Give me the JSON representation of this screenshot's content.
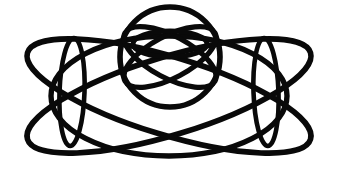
{
  "image": {
    "title": "Abstract symmetric line-art figure",
    "description": "Black ink line drawing of overlapping ellipses and circles forming a symmetric knot-like ornament on a white background",
    "width": 338,
    "height": 181,
    "background_color": "#ffffff",
    "stroke_color": "#090909",
    "style": "line-art",
    "symmetry": "bilateral-vertical-axis",
    "axis_x": 169
  },
  "geometry": {
    "stroke_widths": {
      "heavy": 6.2,
      "main": 5.4,
      "medium": 4.8,
      "fine": 4.2
    },
    "shapes": [
      {
        "name": "outer-dome-ellipse",
        "type": "ellipse",
        "cx": 169,
        "cy": 96,
        "rx": 120,
        "ry": 60,
        "rotation": 0
      },
      {
        "name": "large-ellipse-left-tilt",
        "type": "ellipse",
        "cx": 169,
        "cy": 96,
        "rx": 150,
        "ry": 40,
        "rotation": 17
      },
      {
        "name": "large-ellipse-right-tilt",
        "type": "ellipse",
        "cx": 169,
        "cy": 96,
        "rx": 150,
        "ry": 40,
        "rotation": -17
      },
      {
        "name": "narrow-ellipse-left",
        "type": "ellipse",
        "cx": 72,
        "cy": 92,
        "rx": 13,
        "ry": 54,
        "rotation": 2
      },
      {
        "name": "narrow-ellipse-right",
        "type": "ellipse",
        "cx": 266,
        "cy": 92,
        "rx": 13,
        "ry": 54,
        "rotation": -2
      },
      {
        "name": "center-circle",
        "type": "circle",
        "cx": 170,
        "cy": 57,
        "r": 50
      },
      {
        "name": "inner-lobe-ellipse-left",
        "type": "ellipse",
        "cx": 170,
        "cy": 57,
        "rx": 52,
        "ry": 22,
        "rotation": 28
      },
      {
        "name": "inner-lobe-ellipse-right",
        "type": "ellipse",
        "cx": 170,
        "cy": 57,
        "rx": 52,
        "ry": 22,
        "rotation": -28
      },
      {
        "name": "inner-bowtie-ellipse",
        "type": "ellipse",
        "cx": 170,
        "cy": 44,
        "rx": 38,
        "ry": 14,
        "rotation": 0
      }
    ],
    "crossings": [
      {
        "name": "upper-x-crossing",
        "x": 170,
        "y": 32
      },
      {
        "name": "lower-x-crossing",
        "x": 170,
        "y": 82
      },
      {
        "name": "left-node",
        "x": 72,
        "y": 38
      },
      {
        "name": "right-node",
        "x": 266,
        "y": 38
      },
      {
        "name": "left-tail-tip",
        "x": 26,
        "y": 148
      },
      {
        "name": "right-tail-tip",
        "x": 312,
        "y": 148
      }
    ]
  }
}
